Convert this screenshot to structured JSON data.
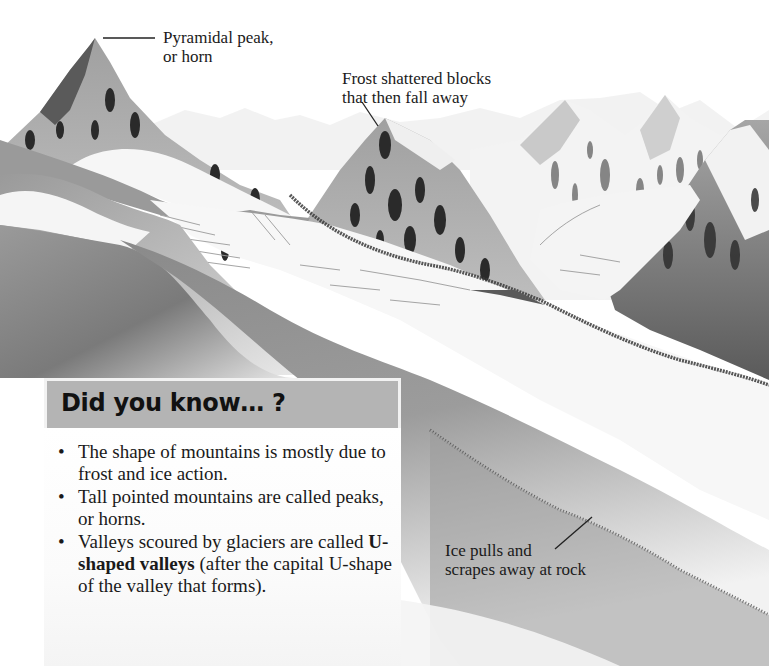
{
  "illustration": {
    "subject": "glacial mountain landscape with U-shaped valleys",
    "palette": {
      "sky": "#ffffff",
      "snow": "#f4f4f4",
      "rock_light": "#b8b8b8",
      "rock_mid": "#8c8c8c",
      "rock_dark": "#3a3a3a",
      "valley_shadow": "#6e6e6e",
      "ice": "#f7f7f7"
    }
  },
  "labels": {
    "pyramidal_peak": "Pyramidal peak,\nor horn",
    "frost_shattered": "Frost shattered blocks\nthat then fall away",
    "ice_pulls": "Ice pulls and\nscrapes away at rock"
  },
  "did_you_know": {
    "title": "Did you know… ?",
    "header_color": "#b4b4b4",
    "bullet_glyph": "•",
    "items": [
      {
        "text": "The shape of mountains is mostly due to frost and ice action."
      },
      {
        "text": "Tall pointed mountains are called peaks, or horns."
      },
      {
        "bold": "U-shaped valleys",
        "before": "Valleys scoured by glaciers are called ",
        "after": " (after the capital U-shape of the valley that forms)."
      }
    ]
  }
}
